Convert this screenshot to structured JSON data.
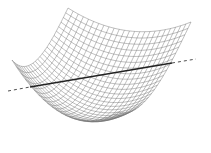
{
  "figure": {
    "width": 211,
    "height": 153,
    "background": "#ffffff",
    "mesh": {
      "grid_lines": 24,
      "color": "#707070",
      "stroke_width": 0.45,
      "corners": {
        "back_top": [
          68,
          8
        ],
        "right": [
          191,
          22
        ],
        "left": [
          12,
          60
        ],
        "front": [
          118,
          112
        ]
      },
      "bowl_bottom": [
        100,
        141
      ],
      "sag": 58
    },
    "line": {
      "color": "#222222",
      "solid_start": [
        30,
        87
      ],
      "solid_end": [
        172,
        63
      ],
      "dashed_left_start": [
        8,
        91
      ],
      "dashed_right_end": [
        196,
        59
      ],
      "solid_width": 1.4,
      "dashed_width": 0.8,
      "dash": "3,3"
    }
  }
}
